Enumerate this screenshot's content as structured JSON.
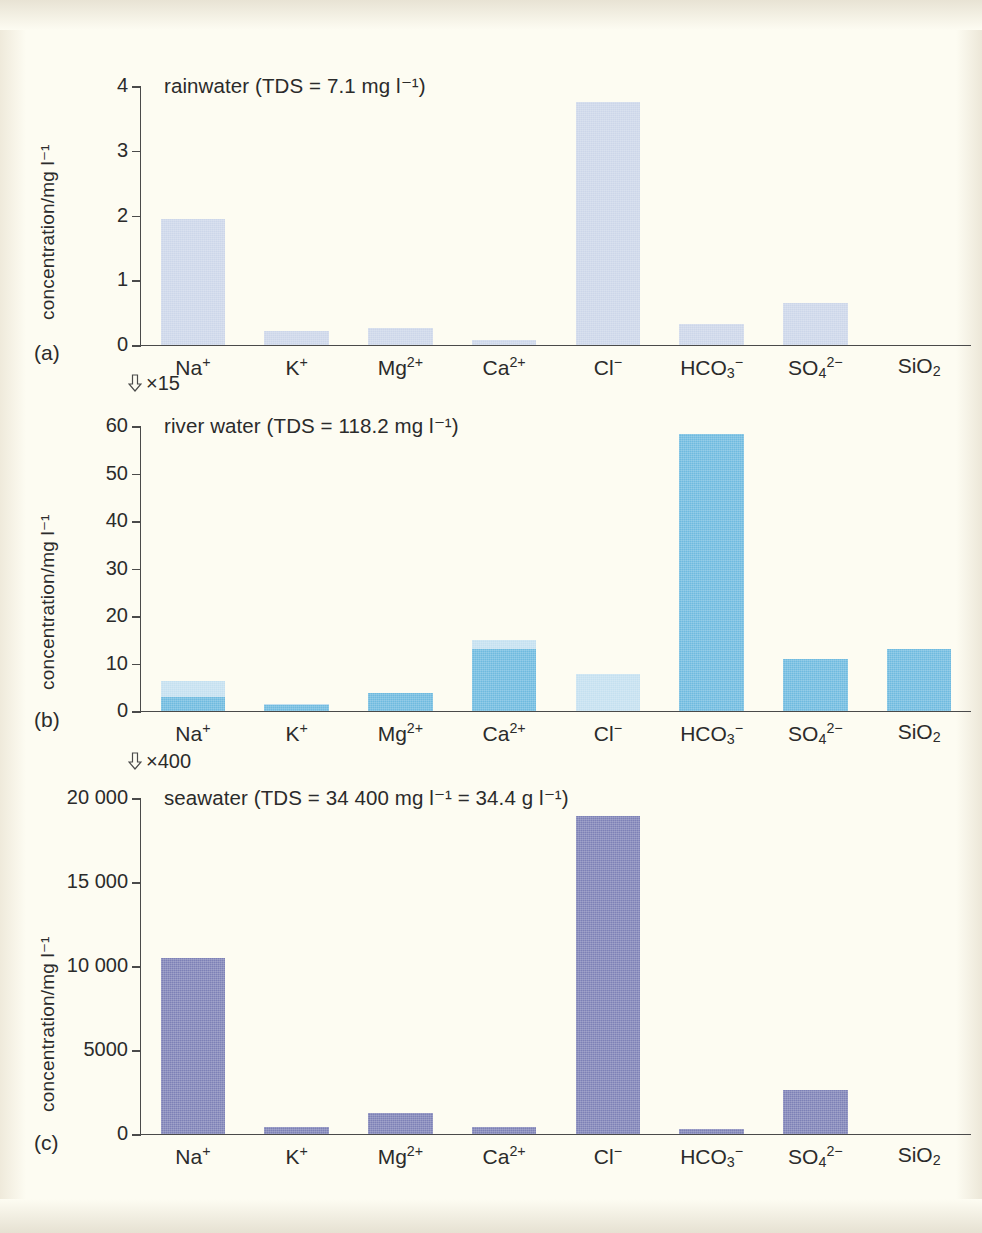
{
  "figure": {
    "background_color": "#fdfcf2",
    "y_axis_label": "concentration/mg l⁻¹",
    "categories": [
      "Na+",
      "K+",
      "Mg2+",
      "Ca2+",
      "Cl-",
      "HCO3-",
      "SO42-",
      "SiO2"
    ],
    "category_labels_html": [
      "Na<sup>+</sup>",
      "K<sup>+</sup>",
      "Mg<sup>2+</sup>",
      "Ca<sup>2+</sup>",
      "Cl<sup>−</sup>",
      "HCO<sub>3</sub><sup>−</sup>",
      "SO<sub>4</sub><sup>2−</sup>",
      "SiO<sub>2</sub>"
    ],
    "scale_notes": [
      {
        "id": "note-a-to-b",
        "icon": "arrow-down-icon",
        "text": "×15",
        "multiplier": 15
      },
      {
        "id": "note-b-to-c",
        "icon": "arrow-down-icon",
        "text": "×400",
        "multiplier": 400
      }
    ],
    "panels": [
      {
        "tag": "(a)",
        "title": "rainwater (TDS = 7.1 mg l⁻¹)",
        "tds": "7.1 mg l⁻¹",
        "bar_color": "#ccd6e9",
        "bar_color_light": "#dfe6f2",
        "tick_labels": [
          "0",
          "1",
          "2",
          "3",
          "4"
        ]
      },
      {
        "tag": "(b)",
        "title": "river water (TDS = 118.2 mg l⁻¹)",
        "tds": "118.2 mg l⁻¹",
        "bar_color": "#6ebadf",
        "bar_color_light": "#c4e0f0",
        "tick_labels": [
          "0",
          "10",
          "20",
          "30",
          "40",
          "50",
          "60"
        ]
      },
      {
        "tag": "(c)",
        "title": "seawater (TDS = 34 400 mg l⁻¹ = 34.4 g l⁻¹)",
        "tds": "34 400 mg l⁻¹ = 34.4 g l⁻¹",
        "bar_color": "#7d81b6",
        "bar_color_light": "#9aa0cb",
        "tick_labels": [
          "0",
          "5000",
          "10 000",
          "15 000",
          "20 000"
        ]
      }
    ]
  },
  "chart_data": [
    {
      "id": "panel-a",
      "type": "bar",
      "title": "rainwater (TDS = 7.1 mg l⁻¹)",
      "xlabel": "",
      "ylabel": "concentration/mg l⁻¹",
      "ylim": [
        0,
        4
      ],
      "yticks": [
        0,
        1,
        2,
        3,
        4
      ],
      "grid": false,
      "legend": "none",
      "categories": [
        "Na+",
        "K+",
        "Mg2+",
        "Ca2+",
        "Cl-",
        "HCO3-",
        "SO42-",
        "SiO2"
      ],
      "values": [
        1.95,
        0.21,
        0.27,
        0.07,
        3.75,
        0.32,
        0.65,
        0.0
      ],
      "color": "#ccd6e9"
    },
    {
      "id": "panel-b",
      "type": "bar",
      "title": "river water (TDS = 118.2 mg l⁻¹)",
      "xlabel": "",
      "ylabel": "concentration/mg l⁻¹",
      "ylim": [
        0,
        60
      ],
      "yticks": [
        0,
        10,
        20,
        30,
        40,
        50,
        60
      ],
      "grid": false,
      "legend": "none",
      "categories": [
        "Na+",
        "K+",
        "Mg2+",
        "Ca2+",
        "Cl-",
        "HCO3-",
        "SO42-",
        "SiO2"
      ],
      "values": [
        6.3,
        1.5,
        3.7,
        15.0,
        7.8,
        58.4,
        11.0,
        13.1
      ],
      "series": [
        {
          "name": "lower (dark) portion",
          "values": [
            3.0,
            1.4,
            3.7,
            13.0,
            0.0,
            58.4,
            11.0,
            13.1
          ],
          "color": "#6ebadf"
        },
        {
          "name": "upper (light) portion",
          "values": [
            3.3,
            0.1,
            0.0,
            2.0,
            7.8,
            0.0,
            0.0,
            0.0
          ],
          "color": "#c4e0f0"
        }
      ],
      "color": "#6ebadf"
    },
    {
      "id": "panel-c",
      "type": "bar",
      "title": "seawater (TDS = 34 400 mg l⁻¹ = 34.4 g l⁻¹)",
      "xlabel": "",
      "ylabel": "concentration/mg l⁻¹",
      "ylim": [
        0,
        20000
      ],
      "yticks": [
        0,
        5000,
        10000,
        15000,
        20000
      ],
      "grid": false,
      "legend": "none",
      "categories": [
        "Na+",
        "K+",
        "Mg2+",
        "Ca2+",
        "Cl-",
        "HCO3-",
        "SO42-",
        "SiO2"
      ],
      "values": [
        10500,
        390,
        1270,
        410,
        18900,
        280,
        2600,
        0
      ],
      "color": "#7d81b6"
    }
  ]
}
